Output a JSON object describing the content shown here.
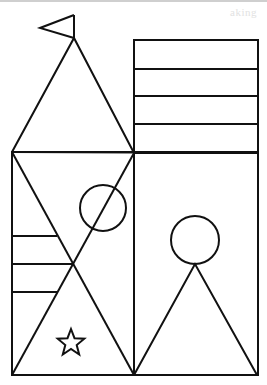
{
  "figure": {
    "bleed_through_text": "aking",
    "stroke_color": "#111111",
    "background": "#ffffff",
    "shapes": {
      "flag": {
        "pole_top": [
          74,
          15
        ],
        "pole_bottom": [
          74,
          38
        ],
        "tip": [
          40,
          28
        ]
      },
      "roof_triangle": {
        "apex": [
          74,
          38
        ],
        "left": [
          12,
          152
        ],
        "right": [
          134,
          153
        ]
      },
      "striped_rectangle": {
        "x": 134,
        "y": 40,
        "width": 124,
        "height": 113,
        "stripe_ys": [
          69,
          96,
          124
        ]
      },
      "left_body": {
        "x": 12,
        "y": 152,
        "width": 122,
        "height": 223
      },
      "right_body": {
        "x": 134,
        "y": 153,
        "width": 124,
        "height": 222
      },
      "x_brace": {
        "crossing": [
          72,
          264
        ]
      },
      "left_stripes_ys": [
        236,
        264,
        292
      ],
      "circle_left": {
        "cx": 103,
        "cy": 208,
        "r": 23
      },
      "circle_right": {
        "cx": 195,
        "cy": 240,
        "r": 24
      },
      "triangle_right": {
        "apex": [
          195,
          264
        ],
        "left": [
          134,
          375
        ],
        "right": [
          257,
          375
        ]
      },
      "star": {
        "cx": 71,
        "cy": 343,
        "r_outer": 14,
        "r_inner": 6
      }
    }
  }
}
